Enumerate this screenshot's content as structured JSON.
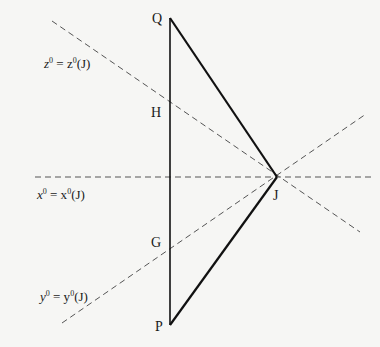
{
  "diagram": {
    "points": {
      "Q": {
        "label": "Q",
        "x": 170,
        "y": 18
      },
      "H": {
        "label": "H",
        "x": 170,
        "y": 101
      },
      "G": {
        "label": "G",
        "x": 170,
        "y": 249
      },
      "P": {
        "label": "P",
        "x": 170,
        "y": 325
      },
      "J": {
        "label": "J",
        "x": 277,
        "y": 177
      }
    },
    "dashed_lines": [
      {
        "name": "z0-line",
        "label_var": "z",
        "label_sup": "0",
        "label_rhs": "= z",
        "label_rhs_sup": "0",
        "label_arg": "(J)",
        "x1": 52,
        "y1": 21,
        "x2": 360,
        "y2": 232
      },
      {
        "name": "x0-line",
        "label_var": "x",
        "label_sup": "0",
        "label_rhs": "= x",
        "label_rhs_sup": "0",
        "label_arg": "(J)",
        "x1": 35,
        "y1": 177,
        "x2": 372,
        "y2": 177
      },
      {
        "name": "y0-line",
        "label_var": "y",
        "label_sup": "0",
        "label_rhs": "= y",
        "label_rhs_sup": "0",
        "label_arg": "(J)",
        "x1": 62,
        "y1": 323,
        "x2": 366,
        "y2": 114
      }
    ],
    "solid_segments": [
      "Q-P",
      "Q-J",
      "J-P"
    ],
    "colors": {
      "solid": "#111111",
      "dashed": "#555555"
    }
  }
}
